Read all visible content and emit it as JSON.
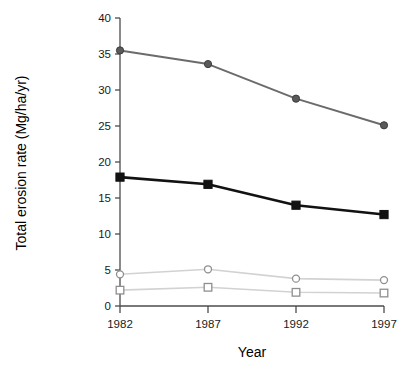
{
  "chart_data": {
    "type": "line",
    "title": "",
    "xlabel": "Year",
    "ylabel": "Total erosion rate (Mg/ha/yr)",
    "categories": [
      "1982",
      "1987",
      "1992",
      "1997"
    ],
    "x": [
      1982,
      1987,
      1992,
      1997
    ],
    "xlim": [
      1982,
      1997
    ],
    "ylim": [
      0,
      40
    ],
    "yticks": [
      0,
      5,
      10,
      15,
      20,
      25,
      30,
      35,
      40
    ],
    "ytick_labels": [
      "0",
      "5",
      "10",
      "15",
      "20",
      "25",
      "30",
      "35",
      "40"
    ],
    "grid": false,
    "legend": "none",
    "series": [
      {
        "name": "series-filled-circle",
        "values": [
          35.5,
          33.6,
          28.8,
          25.1
        ],
        "marker": "filled-circle",
        "color": "#5a5a5a",
        "line_color": "#6b6b6b",
        "line_width": 2.0,
        "marker_size": 7.2
      },
      {
        "name": "series-filled-square",
        "values": [
          17.9,
          16.9,
          14.0,
          12.7
        ],
        "marker": "filled-square",
        "color": "#121212",
        "line_color": "#121212",
        "line_width": 2.6,
        "marker_size": 8.2
      },
      {
        "name": "series-open-circle",
        "values": [
          4.4,
          5.1,
          3.8,
          3.6
        ],
        "marker": "open-circle",
        "color": "#8f8f8f",
        "line_color": "#d2d2d2",
        "line_width": 1.6,
        "marker_size": 7.0
      },
      {
        "name": "series-open-square",
        "values": [
          2.2,
          2.6,
          1.9,
          1.8
        ],
        "marker": "open-square",
        "color": "#8f8f8f",
        "line_color": "#d2d2d2",
        "line_width": 1.6,
        "marker_size": 7.6
      }
    ]
  },
  "axes": {
    "x_title": "Year",
    "y_title": "Total erosion rate (Mg/ha/yr)",
    "axis_color": "#4d4d4d"
  }
}
